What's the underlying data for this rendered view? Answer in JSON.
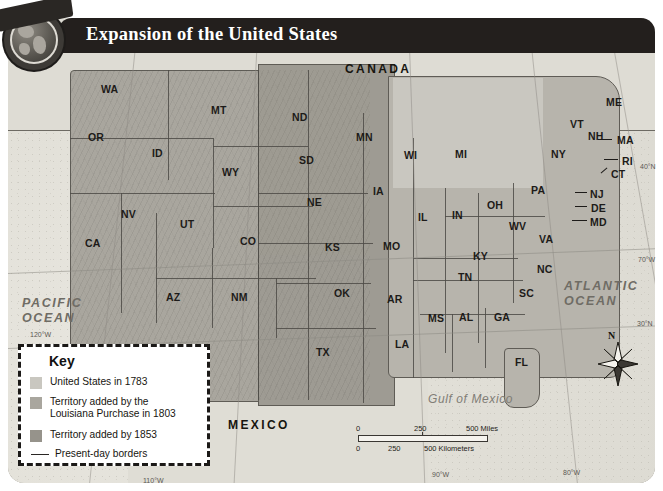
{
  "badge": {
    "label": "MAP SKILL",
    "icon": "globe-icon"
  },
  "banner": {
    "title": "Expansion of the United States"
  },
  "countries": [
    {
      "name": "canada",
      "label": "CANADA",
      "x": 345,
      "y": 62
    },
    {
      "name": "mexico",
      "label": "MEXICO",
      "x": 228,
      "y": 418
    }
  ],
  "oceans": [
    {
      "name": "pacific-ocean",
      "line1": "PACIFIC",
      "line2": "OCEAN",
      "x": 22,
      "y": 296
    },
    {
      "name": "atlantic-ocean",
      "line1": "ATLANTIC",
      "line2": "OCEAN",
      "x": 564,
      "y": 279
    }
  ],
  "water_bodies": [
    {
      "name": "gulf-of-mexico",
      "label": "Gulf of Mexico",
      "x": 428,
      "y": 392
    }
  ],
  "states": [
    {
      "abbr": "WA",
      "x": 101,
      "y": 83
    },
    {
      "abbr": "MT",
      "x": 211,
      "y": 104
    },
    {
      "abbr": "ND",
      "x": 292,
      "y": 111
    },
    {
      "abbr": "MN",
      "x": 356,
      "y": 131
    },
    {
      "abbr": "OR",
      "x": 88,
      "y": 131
    },
    {
      "abbr": "ID",
      "x": 152,
      "y": 147
    },
    {
      "abbr": "WI",
      "x": 404,
      "y": 149
    },
    {
      "abbr": "MI",
      "x": 455,
      "y": 148
    },
    {
      "abbr": "SD",
      "x": 299,
      "y": 154
    },
    {
      "abbr": "WY",
      "x": 222,
      "y": 166
    },
    {
      "abbr": "NY",
      "x": 551,
      "y": 148
    },
    {
      "abbr": "ME",
      "x": 606,
      "y": 96
    },
    {
      "abbr": "VT",
      "x": 570,
      "y": 118
    },
    {
      "abbr": "NH",
      "x": 588,
      "y": 130
    },
    {
      "abbr": "MA",
      "x": 617,
      "y": 134
    },
    {
      "abbr": "RI",
      "x": 622,
      "y": 155
    },
    {
      "abbr": "CT",
      "x": 611,
      "y": 168
    },
    {
      "abbr": "NE",
      "x": 307,
      "y": 196
    },
    {
      "abbr": "IA",
      "x": 373,
      "y": 185
    },
    {
      "abbr": "IL",
      "x": 418,
      "y": 211
    },
    {
      "abbr": "IN",
      "x": 452,
      "y": 209
    },
    {
      "abbr": "OH",
      "x": 487,
      "y": 199
    },
    {
      "abbr": "PA",
      "x": 531,
      "y": 184
    },
    {
      "abbr": "NJ",
      "x": 590,
      "y": 188
    },
    {
      "abbr": "DE",
      "x": 591,
      "y": 202
    },
    {
      "abbr": "MD",
      "x": 590,
      "y": 216
    },
    {
      "abbr": "WV",
      "x": 509,
      "y": 220
    },
    {
      "abbr": "VA",
      "x": 539,
      "y": 233
    },
    {
      "abbr": "NV",
      "x": 121,
      "y": 208
    },
    {
      "abbr": "UT",
      "x": 180,
      "y": 218
    },
    {
      "abbr": "CO",
      "x": 240,
      "y": 235
    },
    {
      "abbr": "KS",
      "x": 325,
      "y": 241
    },
    {
      "abbr": "MO",
      "x": 383,
      "y": 240
    },
    {
      "abbr": "KY",
      "x": 473,
      "y": 250
    },
    {
      "abbr": "CA",
      "x": 85,
      "y": 237
    },
    {
      "abbr": "TN",
      "x": 458,
      "y": 271
    },
    {
      "abbr": "NC",
      "x": 537,
      "y": 263
    },
    {
      "abbr": "AZ",
      "x": 166,
      "y": 291
    },
    {
      "abbr": "NM",
      "x": 231,
      "y": 291
    },
    {
      "abbr": "OK",
      "x": 334,
      "y": 287
    },
    {
      "abbr": "AR",
      "x": 387,
      "y": 293
    },
    {
      "abbr": "SC",
      "x": 519,
      "y": 287
    },
    {
      "abbr": "MS",
      "x": 428,
      "y": 312
    },
    {
      "abbr": "AL",
      "x": 459,
      "y": 311
    },
    {
      "abbr": "GA",
      "x": 494,
      "y": 311
    },
    {
      "abbr": "TX",
      "x": 316,
      "y": 346
    },
    {
      "abbr": "LA",
      "x": 395,
      "y": 338
    },
    {
      "abbr": "FL",
      "x": 515,
      "y": 356
    }
  ],
  "graticule_labels": [
    {
      "label": "120°W",
      "x": 30,
      "y": 331
    },
    {
      "label": "110°W",
      "x": 143,
      "y": 477
    },
    {
      "label": "90°W",
      "x": 432,
      "y": 471
    },
    {
      "label": "80°W",
      "x": 563,
      "y": 469
    },
    {
      "label": "70°W",
      "x": 638,
      "y": 256
    },
    {
      "label": "30°N",
      "x": 637,
      "y": 320
    },
    {
      "label": "40°N",
      "x": 640,
      "y": 163
    }
  ],
  "key": {
    "title": "Key",
    "items": [
      {
        "name": "key-us-1783",
        "label": "United States in 1783",
        "color": "#c9c7c0"
      },
      {
        "name": "key-louisiana",
        "label": "Territory added by the\nLouisiana Purchase in 1803",
        "color": "#a9a69e"
      },
      {
        "name": "key-1853",
        "label": "Territory added by 1853",
        "color": "#96938b"
      }
    ],
    "line_item": {
      "name": "key-present-borders",
      "label": "Present-day borders"
    }
  },
  "scale": {
    "miles": {
      "start": "0",
      "mid": "250",
      "end": "500 Miles"
    },
    "kilometers": {
      "start": "0",
      "mid": "250",
      "end": "500 Kilometers"
    }
  },
  "compass": {
    "north_label": "N",
    "icon": "compass-rose-icon"
  },
  "colors": {
    "banner_bg": "#231f1d",
    "land_us_1783": "#c9c7c0",
    "land_louisiana": "#a9a69e",
    "land_1853": "#96938b",
    "neighbor_land": "#dedcd4",
    "ocean": "#e2e0d8",
    "border": "#4e4b46"
  }
}
